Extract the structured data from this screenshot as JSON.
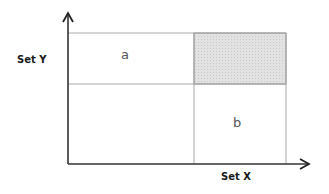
{
  "diagram": {
    "y_axis_label": "Set Y",
    "x_axis_label": "Set X",
    "cells": [
      {
        "position": "top-left",
        "label": "a",
        "shaded": false
      },
      {
        "position": "top-right",
        "label": "",
        "shaded": true
      },
      {
        "position": "bottom-left",
        "label": "",
        "shaded": false
      },
      {
        "position": "bottom-right",
        "label": "b",
        "shaded": false
      }
    ],
    "colors": {
      "axis": "#222222",
      "grid_line": "#999999",
      "shaded_fill": "#dcdcdc"
    }
  }
}
